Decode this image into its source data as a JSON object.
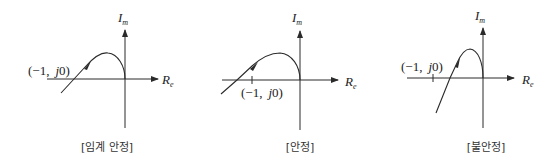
{
  "figure": {
    "axis_labels": {
      "imag": "I",
      "imag_sub": "m",
      "real": "R",
      "real_sub": "e"
    },
    "critical_point_label": {
      "open": "(−1,",
      "j": "j",
      "zero": "0)"
    },
    "panels": [
      {
        "id": "critical",
        "caption": "[임계 안정]",
        "meaning": "Curve passes through (−1, j0)"
      },
      {
        "id": "stable",
        "caption": "[안정]",
        "meaning": "Curve crosses real axis to the right of (−1, j0)... crosses left of origin without enclosing (−1, j0)"
      },
      {
        "id": "unstable",
        "caption": "[불안정]",
        "meaning": "Curve encloses (−1, j0)"
      }
    ]
  }
}
